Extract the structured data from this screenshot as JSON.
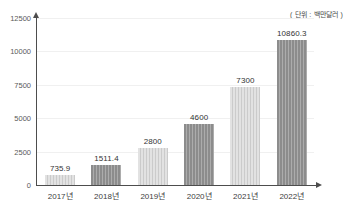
{
  "chart_data": {
    "type": "bar",
    "title": "",
    "subtitle": "",
    "unit_caption": "( 단위 : 백만달러 )",
    "xlabel": "",
    "ylabel": "",
    "categories": [
      "2017년",
      "2018년",
      "2019년",
      "2020년",
      "2021년",
      "2022년"
    ],
    "values": [
      735.9,
      1511.4,
      2800,
      4600,
      7300,
      10860.3
    ],
    "value_labels": [
      "735.9",
      "1511.4",
      "2800",
      "4600",
      "7300",
      "10860.3"
    ],
    "bar_styles": [
      "light",
      "dark",
      "light",
      "dark",
      "light",
      "dark"
    ],
    "ylim": [
      0,
      12500
    ],
    "yticks": [
      0,
      2500,
      5000,
      7500,
      10000,
      12500
    ],
    "ytick_labels": [
      "0",
      "2500",
      "5000",
      "7500",
      "10000",
      "12500"
    ],
    "grid": true,
    "legend": null,
    "colors": {
      "bar_dark": "#8c8c8c",
      "bar_light": "#e2e2e2",
      "axis": "#4d4d4d",
      "gridline": "#f0f0f0",
      "text": "#333333",
      "background": "#ffffff"
    }
  }
}
